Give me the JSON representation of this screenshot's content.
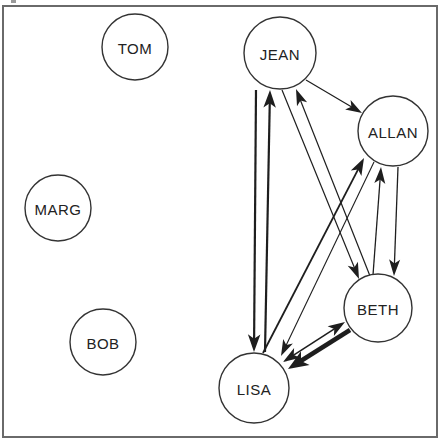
{
  "diagram": {
    "type": "directed-graph",
    "frame": {
      "x": 3,
      "y": 6,
      "width": 434,
      "height": 431,
      "stroke": "#6a6a6a"
    },
    "colors": {
      "line": "#1e1e1e",
      "node_stroke": "#333333",
      "text": "#222222",
      "background": "#ffffff"
    },
    "nodes": [
      {
        "id": "jean",
        "label": "JEAN",
        "cx": 280,
        "cy": 53,
        "r": 36
      },
      {
        "id": "tom",
        "label": "TOM",
        "cx": 135,
        "cy": 47,
        "r": 33
      },
      {
        "id": "allan",
        "label": "ALLAN",
        "cx": 393,
        "cy": 131,
        "r": 35
      },
      {
        "id": "marg",
        "label": "MARG",
        "cx": 58,
        "cy": 208,
        "r": 33
      },
      {
        "id": "beth",
        "label": "BETH",
        "cx": 378,
        "cy": 308,
        "r": 34
      },
      {
        "id": "bob",
        "label": "BOB",
        "cx": 103,
        "cy": 342,
        "r": 33
      },
      {
        "id": "lisa",
        "label": "LISA",
        "cx": 254,
        "cy": 388,
        "r": 35
      }
    ],
    "edges": [
      {
        "from": "jean",
        "to": "lisa",
        "x1": 256,
        "y1": 90,
        "x2": 254,
        "y2": 352,
        "width": 2.2,
        "heads": "end"
      },
      {
        "from": "lisa",
        "to": "jean",
        "x1": 265,
        "y1": 352,
        "x2": 270,
        "y2": 90,
        "width": 2.2,
        "heads": "end"
      },
      {
        "from": "jean",
        "to": "beth",
        "x1": 282,
        "y1": 90,
        "x2": 359,
        "y2": 279,
        "width": 1.2,
        "heads": "end"
      },
      {
        "from": "beth",
        "to": "jean",
        "x1": 370,
        "y1": 276,
        "x2": 296,
        "y2": 89,
        "width": 1.2,
        "heads": "end"
      },
      {
        "from": "jean",
        "to": "allan",
        "x1": 306,
        "y1": 80,
        "x2": 362,
        "y2": 113,
        "width": 1.2,
        "heads": "end"
      },
      {
        "from": "lisa",
        "to": "allan",
        "x1": 263,
        "y1": 353,
        "x2": 364,
        "y2": 158,
        "width": 1.8,
        "heads": "end"
      },
      {
        "from": "allan",
        "to": "lisa",
        "x1": 374,
        "y1": 162,
        "x2": 281,
        "y2": 356,
        "width": 1.1,
        "heads": "end"
      },
      {
        "from": "beth",
        "to": "allan",
        "x1": 373,
        "y1": 275,
        "x2": 381,
        "y2": 167,
        "width": 1.3,
        "heads": "end"
      },
      {
        "from": "allan",
        "to": "beth",
        "x1": 398,
        "y1": 167,
        "x2": 394,
        "y2": 276,
        "width": 1.3,
        "heads": "end"
      },
      {
        "from": "lisa",
        "to": "beth",
        "x1": 283,
        "y1": 362,
        "x2": 345,
        "y2": 322,
        "width": 1.6,
        "heads": "both"
      },
      {
        "from": "beth",
        "to": "lisa",
        "x1": 350,
        "y1": 330,
        "x2": 288,
        "y2": 369,
        "width": 4.5,
        "heads": "end"
      }
    ]
  }
}
